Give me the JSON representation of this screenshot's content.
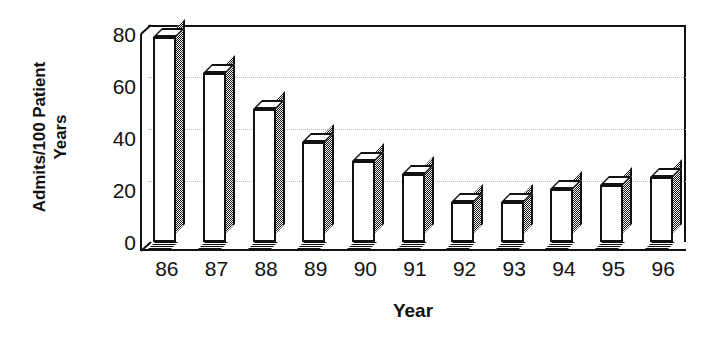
{
  "chart_data": {
    "type": "bar",
    "title": "",
    "subtitle": "",
    "xlabel": "Year",
    "ylabel": "Admits/100 Patient Years",
    "ylabel_lines": [
      "Admits/100 Patient",
      "Years"
    ],
    "categories": [
      "86",
      "87",
      "88",
      "89",
      "90",
      "91",
      "92",
      "93",
      "94",
      "95",
      "96"
    ],
    "values": [
      79,
      65,
      51,
      38.5,
      31,
      26,
      15.5,
      15.5,
      20.5,
      22,
      25
    ],
    "series": [
      {
        "name": "Admits/100 Patient Years",
        "values": [
          79,
          65,
          51,
          38.5,
          31,
          26,
          15.5,
          15.5,
          20.5,
          22,
          25
        ]
      }
    ],
    "ylim": [
      0,
      80
    ],
    "yticks": [
      0,
      20,
      40,
      60,
      80
    ],
    "ytick_labels": [
      "0",
      "20",
      "40",
      "60",
      "80"
    ],
    "gridlines": [
      20,
      40,
      60
    ],
    "grid": true,
    "legend": false,
    "legend_position": "none",
    "style": "3d-bar-white-black-outline",
    "colors": {
      "bar_face": "#ffffff",
      "bar_outline": "#111111",
      "bar_side_hatch": "#101010",
      "grid": "#b9b9b9",
      "axis": "#111111",
      "text": "#111111",
      "background": "#ffffff"
    }
  }
}
